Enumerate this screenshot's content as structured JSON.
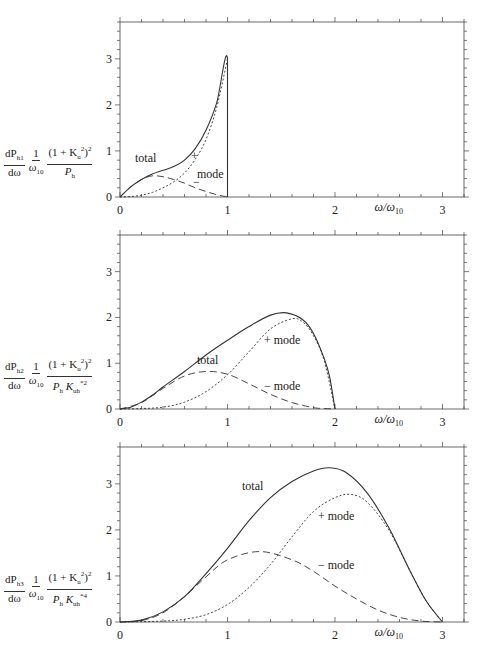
{
  "chart_data": [
    {
      "type": "line",
      "panel": 1,
      "ylabel": "dP_h1/dω · 1/ω_10 · (1 + K_u^2)^2 / P_h",
      "xlabel": "ω/ω_10",
      "xlim": [
        0,
        3.2
      ],
      "ylim": [
        0,
        3.8
      ],
      "xticks": [
        0,
        1,
        2,
        3
      ],
      "yticks": [
        0,
        1,
        2,
        3
      ],
      "annotations": [
        "total",
        "+",
        "mode",
        "−"
      ],
      "series": [
        {
          "name": "total",
          "style": "solid",
          "x": [
            0,
            0.1,
            0.2,
            0.3,
            0.4,
            0.5,
            0.6,
            0.7,
            0.8,
            0.9,
            1.0,
            1.0
          ],
          "y": [
            0,
            0.22,
            0.38,
            0.5,
            0.58,
            0.66,
            0.8,
            1.05,
            1.45,
            2.05,
            3.0,
            0
          ]
        },
        {
          "name": "+ mode",
          "style": "dotted",
          "x": [
            0,
            0.1,
            0.2,
            0.3,
            0.4,
            0.5,
            0.6,
            0.7,
            0.8,
            0.9,
            1.0
          ],
          "y": [
            0,
            0.01,
            0.04,
            0.1,
            0.2,
            0.33,
            0.52,
            0.82,
            1.25,
            1.95,
            3.0
          ]
        },
        {
          "name": "− mode",
          "style": "dashed",
          "x": [
            0,
            0.1,
            0.2,
            0.3,
            0.4,
            0.5,
            0.6,
            0.7,
            0.8,
            0.9,
            1.0
          ],
          "y": [
            0,
            0.22,
            0.38,
            0.46,
            0.44,
            0.38,
            0.3,
            0.2,
            0.12,
            0.05,
            0
          ]
        }
      ]
    },
    {
      "type": "line",
      "panel": 2,
      "ylabel": "dP_h2/dω · 1/ω_10 · (1 + K_u^2)^2 / (P_h K_uh^*2)",
      "xlabel": "ω/ω_10",
      "xlim": [
        0,
        3.2
      ],
      "ylim": [
        0,
        3.8
      ],
      "xticks": [
        0,
        1,
        2,
        3
      ],
      "yticks": [
        0,
        1,
        2,
        3
      ],
      "annotations": [
        "total",
        "+ mode",
        "− mode"
      ],
      "series": [
        {
          "name": "total",
          "style": "solid",
          "x": [
            0,
            0.1,
            0.2,
            0.3,
            0.4,
            0.6,
            0.8,
            1.0,
            1.2,
            1.4,
            1.55,
            1.7,
            1.8,
            1.9,
            1.95,
            2.0
          ],
          "y": [
            0,
            0.04,
            0.15,
            0.3,
            0.48,
            0.82,
            1.18,
            1.5,
            1.8,
            2.05,
            2.1,
            1.95,
            1.65,
            1.1,
            0.7,
            0
          ]
        },
        {
          "name": "+ mode",
          "style": "dotted",
          "x": [
            0,
            0.2,
            0.4,
            0.6,
            0.8,
            1.0,
            1.2,
            1.4,
            1.6,
            1.7,
            1.8,
            1.9,
            2.0
          ],
          "y": [
            0,
            0.01,
            0.04,
            0.15,
            0.38,
            0.75,
            1.25,
            1.75,
            1.97,
            1.9,
            1.6,
            1.05,
            0
          ]
        },
        {
          "name": "− mode",
          "style": "dashed",
          "x": [
            0,
            0.2,
            0.4,
            0.6,
            0.8,
            1.0,
            1.2,
            1.4,
            1.6,
            1.8,
            1.9,
            2.0
          ],
          "y": [
            0,
            0.14,
            0.45,
            0.72,
            0.82,
            0.76,
            0.55,
            0.32,
            0.14,
            0.03,
            0.01,
            0
          ]
        }
      ]
    },
    {
      "type": "line",
      "panel": 3,
      "ylabel": "dP_h3/dω · 1/ω_10 · (1 + K_u^2)^2 / (P_h K_uh^*4)",
      "xlabel": "ω/ω_10",
      "xlim": [
        0,
        3.2
      ],
      "ylim": [
        0,
        3.8
      ],
      "xticks": [
        0,
        1,
        2,
        3
      ],
      "yticks": [
        0,
        1,
        2,
        3
      ],
      "annotations": [
        "total",
        "+ mode",
        "− mode"
      ],
      "series": [
        {
          "name": "total",
          "style": "solid",
          "x": [
            0,
            0.2,
            0.4,
            0.6,
            0.8,
            1.0,
            1.2,
            1.4,
            1.6,
            1.8,
            1.95,
            2.1,
            2.3,
            2.5,
            2.7,
            2.85,
            3.0
          ],
          "y": [
            0,
            0.04,
            0.22,
            0.55,
            1.05,
            1.6,
            2.2,
            2.7,
            3.05,
            3.28,
            3.35,
            3.25,
            2.8,
            2.05,
            1.1,
            0.45,
            0
          ]
        },
        {
          "name": "+ mode",
          "style": "dotted",
          "x": [
            0,
            0.4,
            0.6,
            0.8,
            1.0,
            1.2,
            1.4,
            1.6,
            1.8,
            2.0,
            2.15,
            2.3,
            2.5,
            2.7,
            2.85,
            3.0
          ],
          "y": [
            0,
            0.02,
            0.06,
            0.16,
            0.38,
            0.75,
            1.25,
            1.85,
            2.4,
            2.7,
            2.77,
            2.6,
            2.0,
            1.1,
            0.45,
            0
          ]
        },
        {
          "name": "− mode",
          "style": "dashed",
          "x": [
            0,
            0.2,
            0.4,
            0.6,
            0.8,
            1.0,
            1.3,
            1.6,
            1.8,
            2.0,
            2.2,
            2.4,
            2.6,
            2.8,
            3.0
          ],
          "y": [
            0,
            0.03,
            0.2,
            0.55,
            0.98,
            1.35,
            1.53,
            1.35,
            1.1,
            0.78,
            0.5,
            0.26,
            0.1,
            0.02,
            0
          ]
        }
      ]
    }
  ],
  "panels": [
    {
      "ylabel": {
        "num1": "dP",
        "sub1": "h1",
        "den1": "dω",
        "num2": "1",
        "den2": "ω",
        "den2sub": "10",
        "num3": "(1 + K",
        "num3sub": "u",
        "num3sup": "2",
        "num3end": ")",
        "num3pow": "2",
        "den3": "P",
        "den3sub": "h",
        "den3k": "",
        "den3ksub": "",
        "den3ksup": ""
      },
      "labels": {
        "total": "total",
        "plus": "+",
        "mode": "mode",
        "minus": "−"
      },
      "xlabel": "ω/ω",
      "xlabel_sub": "10",
      "xticks": [
        "0",
        "1",
        "2",
        "3"
      ],
      "yticks": [
        "0",
        "1",
        "2",
        "3"
      ]
    },
    {
      "ylabel": {
        "num1": "dP",
        "sub1": "h2",
        "den1": "dω",
        "num2": "1",
        "den2": "ω",
        "den2sub": "10",
        "num3": "(1 + K",
        "num3sub": "u",
        "num3sup": "2",
        "num3end": ")",
        "num3pow": "2",
        "den3": "P",
        "den3sub": "h",
        "den3k": "K",
        "den3ksub": "uh",
        "den3ksup": "*2"
      },
      "labels": {
        "total": "total",
        "plus": "+ mode",
        "minus": "− mode"
      },
      "xlabel": "ω/ω",
      "xlabel_sub": "10",
      "xticks": [
        "0",
        "1",
        "2",
        "3"
      ],
      "yticks": [
        "0",
        "1",
        "2",
        "3"
      ]
    },
    {
      "ylabel": {
        "num1": "dP",
        "sub1": "h3",
        "den1": "dω",
        "num2": "1",
        "den2": "ω",
        "den2sub": "10",
        "num3": "(1 + K",
        "num3sub": "u",
        "num3sup": "2",
        "num3end": ")",
        "num3pow": "2",
        "den3": "P",
        "den3sub": "h",
        "den3k": "K",
        "den3ksub": "uh",
        "den3ksup": "*4"
      },
      "labels": {
        "total": "total",
        "plus": "+ mode",
        "minus": "− mode"
      },
      "xlabel": "ω/ω",
      "xlabel_sub": "10",
      "xticks": [
        "0",
        "1",
        "2",
        "3"
      ],
      "yticks": [
        "0",
        "1",
        "2",
        "3"
      ]
    }
  ]
}
